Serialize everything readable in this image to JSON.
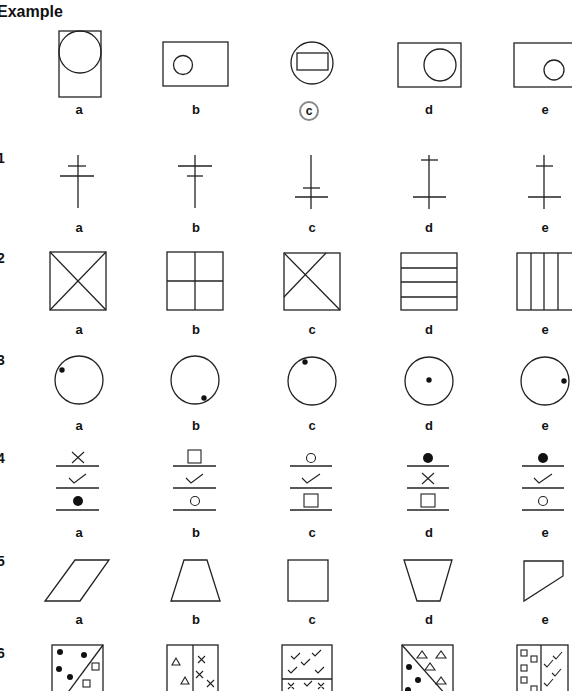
{
  "title": "Example",
  "rows": [
    {
      "id": "example",
      "number": "",
      "options": [
        "a",
        "b",
        "c",
        "d",
        "e"
      ],
      "answer": "c"
    },
    {
      "id": "q1",
      "number": "1",
      "options": [
        "a",
        "b",
        "c",
        "d",
        "e"
      ]
    },
    {
      "id": "q2",
      "number": "2",
      "options": [
        "a",
        "b",
        "c",
        "d",
        "e"
      ]
    },
    {
      "id": "q3",
      "number": "3",
      "options": [
        "a",
        "b",
        "c",
        "d",
        "e"
      ]
    },
    {
      "id": "q4",
      "number": "4",
      "options": [
        "a",
        "b",
        "c",
        "d",
        "e"
      ]
    },
    {
      "id": "q5",
      "number": "5",
      "options": [
        "a",
        "b",
        "c",
        "d",
        "e"
      ]
    },
    {
      "id": "q6",
      "number": "6",
      "options": [
        "a",
        "b",
        "c",
        "d",
        "e"
      ]
    }
  ],
  "figures": {
    "example": [
      "rectangle with large circle at top",
      "wide rectangle with small circle at left",
      "circle containing rectangle",
      "wide rectangle with large circle at right",
      "wide rectangle with small circle at right"
    ],
    "q1": [
      "vertical line with short upper and longer lower crossbar",
      "vertical line with long upper and short lower crossbar",
      "vertical line with two crossbars near bottom",
      "vertical line with crossbars at top and bottom",
      "vertical line with short top crossbar and long bottom crossbar"
    ],
    "q2": [
      "square with both diagonals",
      "square divided into four quarters",
      "square with diagonal and off-center cross line",
      "square with three horizontal lines",
      "square with three vertical lines"
    ],
    "q3": [
      "circle with dot at upper left",
      "circle with dot at lower right",
      "circle with dot at top",
      "circle with dot at center",
      "circle with dot at right edge"
    ],
    "q4": [
      [
        "cross",
        "check",
        "filled circle"
      ],
      [
        "square",
        "check",
        "open circle"
      ],
      [
        "open circle",
        "check",
        "square"
      ],
      [
        "filled circle",
        "cross",
        "square"
      ],
      [
        "filled circle",
        "check",
        "open circle"
      ]
    ],
    "q5": [
      "parallelogram",
      "trapezoid",
      "square",
      "inverted trapezoid",
      "irregular quadrilateral"
    ],
    "q6": [
      "square split diagonally with dots and squares",
      "square split vertically with triangles and crosses",
      "square split horizontally with checks and crosses",
      "square split diagonally with triangles and dots",
      "square split vertically with squares and checks"
    ]
  }
}
